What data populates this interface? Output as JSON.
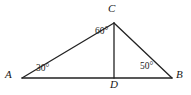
{
  "figure": {
    "kind": "geometry-diagram",
    "stroke_color": "#222222",
    "background_color": "#ffffff",
    "vertices": [
      {
        "id": "A",
        "label": "A",
        "x": 22,
        "y": 78
      },
      {
        "id": "B",
        "label": "B",
        "x": 172,
        "y": 78
      },
      {
        "id": "C",
        "label": "C",
        "x": 114,
        "y": 23
      },
      {
        "id": "D",
        "label": "D",
        "x": 114,
        "y": 78
      }
    ],
    "segments": [
      {
        "id": "AB",
        "from": "A",
        "to": "B"
      },
      {
        "id": "AC",
        "from": "A",
        "to": "C"
      },
      {
        "id": "CB",
        "from": "C",
        "to": "B"
      },
      {
        "id": "CD",
        "from": "C",
        "to": "D"
      }
    ],
    "angles": [
      {
        "id": "angle-A",
        "at": "A",
        "value": 30,
        "label": "30°"
      },
      {
        "id": "angle-C",
        "at": "C",
        "value": 60,
        "label": "60°"
      },
      {
        "id": "angle-B",
        "at": "B",
        "value": 50,
        "label": "50°"
      }
    ]
  }
}
